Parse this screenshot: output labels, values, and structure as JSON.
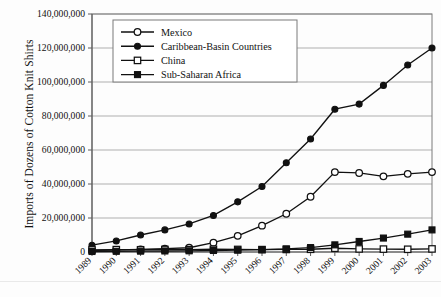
{
  "chart_data": {
    "type": "line",
    "title": "",
    "xlabel": "",
    "ylabel": "Imports of Dozens of Cotton Knit Shirts",
    "categories": [
      "1989",
      "1990",
      "1991",
      "1992",
      "1993",
      "1994",
      "1995",
      "1996",
      "1997",
      "1998",
      "1999",
      "2000",
      "2001",
      "2002",
      "2003"
    ],
    "x": [
      1989,
      1990,
      1991,
      1992,
      1993,
      1994,
      1995,
      1996,
      1997,
      1998,
      1999,
      2000,
      2001,
      2002,
      2003
    ],
    "ylim": [
      0,
      140000000
    ],
    "ytick_values": [
      0,
      20000000,
      40000000,
      60000000,
      80000000,
      100000000,
      120000000,
      140000000
    ],
    "ytick_labels": [
      "0",
      "20,000,000",
      "40,000,000",
      "60,000,000",
      "80,000,000",
      "100,000,000",
      "120,000,000",
      "140,000,000"
    ],
    "grid": true,
    "legend_position": "top-left-inside",
    "series": [
      {
        "name": "Mexico",
        "marker": "open-circle",
        "values": [
          1000000,
          1200000,
          1500000,
          2000000,
          2500000,
          5500000,
          9500000,
          15500000,
          22500000,
          32500000,
          47000000,
          46500000,
          44500000,
          46000000,
          47000000
        ]
      },
      {
        "name": "Caribbean-Basin Countries",
        "marker": "filled-circle",
        "values": [
          4000000,
          6500000,
          10000000,
          13000000,
          16500000,
          21500000,
          29500000,
          38500000,
          52500000,
          66500000,
          84000000,
          87000000,
          98000000,
          110000000,
          120000000
        ]
      },
      {
        "name": "China",
        "marker": "open-square",
        "values": [
          1200000,
          1400000,
          1300000,
          1500000,
          1400000,
          1600000,
          1500000,
          1400000,
          1500000,
          1600000,
          2200000,
          1800000,
          1700000,
          1600000,
          1800000
        ]
      },
      {
        "name": "Sub-Saharan Africa",
        "marker": "filled-square",
        "values": [
          300000,
          400000,
          500000,
          600000,
          700000,
          900000,
          1100000,
          1400000,
          1800000,
          2600000,
          4200000,
          6200000,
          8200000,
          10500000,
          13000000
        ]
      }
    ]
  },
  "legend": {
    "entries": [
      {
        "label": "Mexico"
      },
      {
        "label": "Caribbean-Basin Countries"
      },
      {
        "label": "China"
      },
      {
        "label": "Sub-Saharan Africa"
      }
    ]
  },
  "colors": {
    "series": "#111111",
    "grid": "#8c8c8c",
    "frame": "#7a7a7a",
    "background": "#fdfdfd",
    "text": "#111111"
  }
}
